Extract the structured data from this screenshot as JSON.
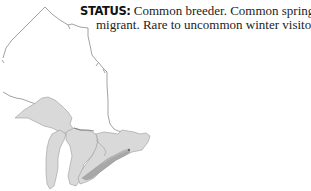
{
  "status": {
    "label": "STATUS:",
    "line1": "Common breeder. Common spring and fall",
    "line2": "migrant. Rare to uncommon winter visitor"
  },
  "map": {
    "region": "Ontario and the Great Lakes",
    "colors": {
      "outline": "#8a8a8a",
      "land": "#d9d9d9",
      "land_edge": "#9a9a9a",
      "range_band": "#a8a8a8",
      "background": "#ffffff"
    },
    "features": [
      "ontario-border",
      "lake-superior",
      "lake-michigan",
      "lake-huron",
      "southern-ontario",
      "range-band"
    ]
  }
}
